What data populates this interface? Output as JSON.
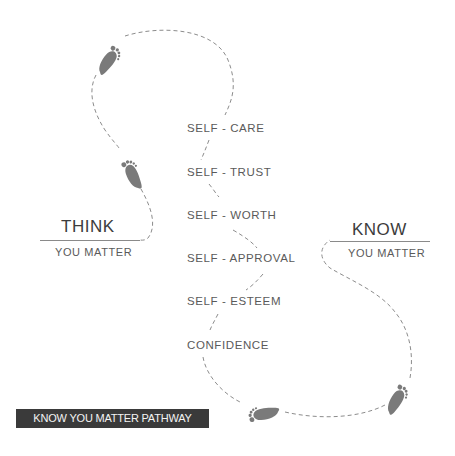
{
  "diagram": {
    "left_label": {
      "title": "THINK",
      "subtitle": "YOU MATTER"
    },
    "right_label": {
      "title": "KNOW",
      "subtitle": "YOU MATTER"
    },
    "steps": [
      "SELF - CARE",
      "SELF - TRUST",
      "SELF - WORTH",
      "SELF - APPROVAL",
      "SELF - ESTEEM",
      "CONFIDENCE"
    ],
    "banner": "KNOW YOU MATTER PATHWAY",
    "icons": [
      "footprint-icon",
      "footprint-icon",
      "footprint-icon",
      "footprint-icon"
    ],
    "colors": {
      "path": "#8c8c8c",
      "footprint": "#7a7a7a",
      "text": "#5a5a5a",
      "banner_bg": "#3a3a3a",
      "banner_text": "#f4f4f4"
    }
  }
}
